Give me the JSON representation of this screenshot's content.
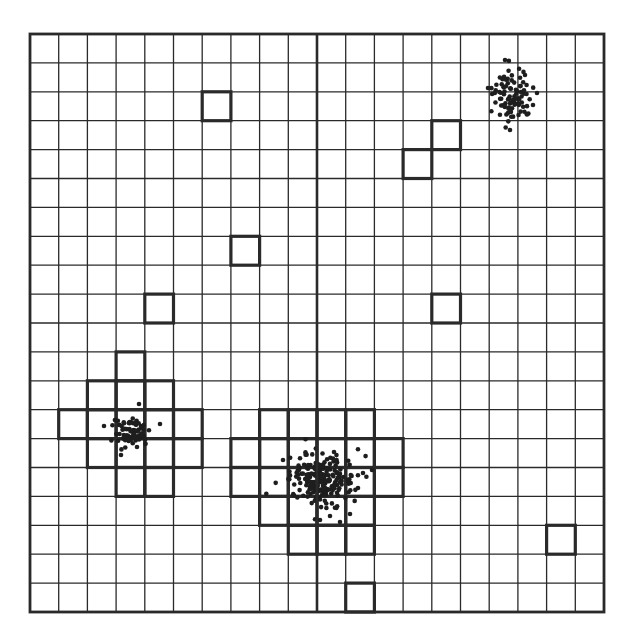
{
  "diagram": {
    "type": "grid-cluster-diagram",
    "grid": {
      "left": 30,
      "top": 34,
      "right": 604,
      "bottom": 612,
      "columns": 20,
      "rows": 20,
      "line_color": "#2a2a2a",
      "thin_line_width": 1.3,
      "border_width": 2.8,
      "divider_column": 10,
      "divider_width": 2.6
    },
    "highlight": {
      "stroke_color": "#2a2a2a",
      "stroke_width": 3.2,
      "cells": [
        {
          "col": 6,
          "row": 2
        },
        {
          "col": 14,
          "row": 3
        },
        {
          "col": 13,
          "row": 4
        },
        {
          "col": 7,
          "row": 7
        },
        {
          "col": 4,
          "row": 9
        },
        {
          "col": 14,
          "row": 9
        },
        {
          "col": 3,
          "row": 11
        },
        {
          "col": 2,
          "row": 12
        },
        {
          "col": 3,
          "row": 12
        },
        {
          "col": 4,
          "row": 12
        },
        {
          "col": 1,
          "row": 13
        },
        {
          "col": 2,
          "row": 13
        },
        {
          "col": 3,
          "row": 13
        },
        {
          "col": 4,
          "row": 13
        },
        {
          "col": 5,
          "row": 13
        },
        {
          "col": 2,
          "row": 14
        },
        {
          "col": 3,
          "row": 14
        },
        {
          "col": 4,
          "row": 14
        },
        {
          "col": 5,
          "row": 14
        },
        {
          "col": 3,
          "row": 15
        },
        {
          "col": 4,
          "row": 15
        },
        {
          "col": 8,
          "row": 13
        },
        {
          "col": 9,
          "row": 13
        },
        {
          "col": 10,
          "row": 13
        },
        {
          "col": 11,
          "row": 13
        },
        {
          "col": 7,
          "row": 14
        },
        {
          "col": 8,
          "row": 14
        },
        {
          "col": 9,
          "row": 14
        },
        {
          "col": 10,
          "row": 14
        },
        {
          "col": 11,
          "row": 14
        },
        {
          "col": 12,
          "row": 14
        },
        {
          "col": 7,
          "row": 15
        },
        {
          "col": 8,
          "row": 15
        },
        {
          "col": 9,
          "row": 15
        },
        {
          "col": 10,
          "row": 15
        },
        {
          "col": 11,
          "row": 15
        },
        {
          "col": 12,
          "row": 15
        },
        {
          "col": 8,
          "row": 16
        },
        {
          "col": 9,
          "row": 16
        },
        {
          "col": 10,
          "row": 16
        },
        {
          "col": 11,
          "row": 16
        },
        {
          "col": 9,
          "row": 17
        },
        {
          "col": 10,
          "row": 17
        },
        {
          "col": 11,
          "row": 17
        },
        {
          "col": 18,
          "row": 17
        },
        {
          "col": 11,
          "row": 19
        }
      ]
    },
    "clusters": [
      {
        "name": "top-right-cluster",
        "cx": 512,
        "cy": 95,
        "sx": 10,
        "sy": 13,
        "count": 90,
        "outliers": [
          [
            488,
            88
          ],
          [
            505,
            60
          ],
          [
            537,
            93
          ],
          [
            533,
            105
          ],
          [
            510,
            130
          ],
          [
            525,
            75
          ]
        ]
      },
      {
        "name": "left-cluster",
        "cx": 132,
        "cy": 432,
        "sx": 9,
        "sy": 8,
        "count": 70,
        "outliers": [
          [
            104,
            426
          ],
          [
            139,
            404
          ],
          [
            160,
            424
          ],
          [
            137,
            447
          ],
          [
            121,
            455
          ]
        ]
      },
      {
        "name": "center-cluster",
        "cx": 322,
        "cy": 480,
        "sx": 16,
        "sy": 12,
        "count": 220,
        "outliers": [
          [
            283,
            460
          ],
          [
            334,
            452
          ],
          [
            363,
            473
          ],
          [
            358,
            488
          ],
          [
            330,
            516
          ],
          [
            340,
            522
          ],
          [
            320,
            520
          ],
          [
            372,
            470
          ],
          [
            350,
            514
          ]
        ]
      }
    ],
    "dot_color": "#1e1e1e",
    "dot_radius": 2.3
  }
}
